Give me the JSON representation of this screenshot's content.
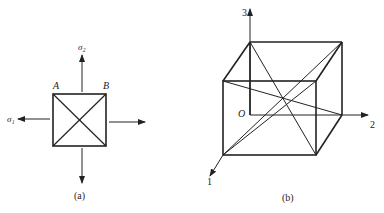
{
  "figure_a": {
    "caption": "(a)",
    "labels": {
      "sigma2": "σ₂",
      "sigma1": "σ₁",
      "corner_a": "A",
      "corner_b": "B"
    }
  },
  "figure_b": {
    "caption": "(b)",
    "labels": {
      "axis3": "3",
      "axis2": "2",
      "axis1": "1",
      "origin": "O"
    }
  },
  "colors": {
    "stroke": "#222222",
    "background": "#ffffff"
  }
}
